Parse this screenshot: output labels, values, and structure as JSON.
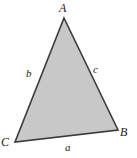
{
  "figure": {
    "type": "geometry-diagram",
    "shape": "triangle",
    "width": 137,
    "height": 158,
    "background_color": "#ffffff",
    "fill_color": "#c8c8c8",
    "stroke_color": "#3a3a3a",
    "stroke_width": 1.6
  },
  "vertices": [
    {
      "id": "A",
      "label": "A",
      "x": 64,
      "y": 18
    },
    {
      "id": "B",
      "label": "B",
      "x": 118,
      "y": 130
    },
    {
      "id": "C",
      "label": "C",
      "x": 15,
      "y": 142
    }
  ],
  "sides": [
    {
      "id": "a",
      "label": "a",
      "opposite_vertex": "A",
      "endpoints": "C-B"
    },
    {
      "id": "b",
      "label": "b",
      "opposite_vertex": "B",
      "endpoints": "C-A"
    },
    {
      "id": "c",
      "label": "c",
      "opposite_vertex": "C",
      "endpoints": "A-B"
    }
  ]
}
